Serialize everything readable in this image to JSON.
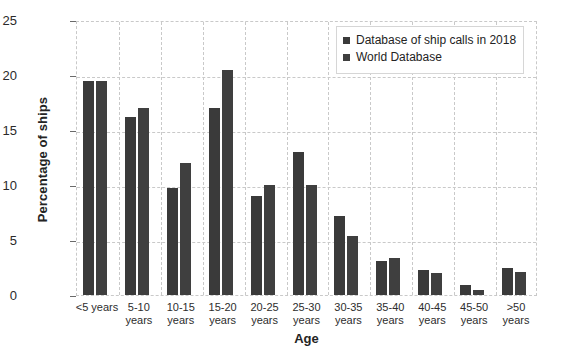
{
  "chart_data": {
    "type": "bar",
    "title": "",
    "xlabel": "Age",
    "ylabel": "Percentage of ships",
    "ylim": [
      0,
      25
    ],
    "yticks": [
      0,
      5,
      10,
      15,
      20,
      25
    ],
    "grid": true,
    "legend_position": "top-right",
    "categories": [
      "<5 years",
      "5-10 years",
      "10-15 years",
      "15-20 years",
      "20-25 years",
      "25-30 years",
      "30-35 years",
      "35-40 years",
      "40-45 years",
      "45-50 years",
      ">50 years"
    ],
    "category_lines": [
      [
        "<5 years",
        ""
      ],
      [
        "5-10",
        "years"
      ],
      [
        "10-15",
        "years"
      ],
      [
        "15-20",
        "years"
      ],
      [
        "20-25",
        "years"
      ],
      [
        "25-30",
        "years"
      ],
      [
        "30-35",
        "years"
      ],
      [
        "35-40",
        "years"
      ],
      [
        "40-45",
        "years"
      ],
      [
        "45-50",
        "years"
      ],
      [
        ">50",
        "years"
      ]
    ],
    "series": [
      {
        "name": "Database of ship calls in 2018",
        "color": "#3a3a3a",
        "values": [
          19.5,
          16.2,
          9.7,
          17.0,
          9.0,
          13.0,
          7.2,
          3.1,
          2.3,
          0.9,
          2.5
        ]
      },
      {
        "name": "World Database",
        "color": "#3f3f3f",
        "values": [
          19.5,
          17.0,
          12.0,
          20.5,
          10.0,
          10.0,
          5.4,
          3.4,
          2.0,
          0.5,
          2.1
        ]
      }
    ]
  },
  "axes": {
    "y_title": "Percentage of ships",
    "x_title": "Age",
    "y_tick_labels": [
      "0",
      "5",
      "10",
      "15",
      "20",
      "25"
    ]
  },
  "legend": {
    "items": [
      {
        "label": "Database of ship calls in 2018",
        "color": "#3a3a3a"
      },
      {
        "label": "World Database",
        "color": "#3f3f3f"
      }
    ]
  },
  "style": {
    "grid_color": "#c9c9c9",
    "background": "#ffffff",
    "text_color": "#242424"
  }
}
